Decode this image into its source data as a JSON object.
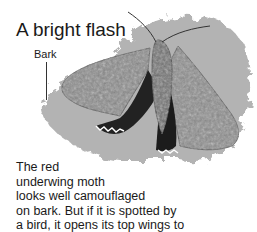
{
  "title": "A bright flash",
  "labels": {
    "bark": "Bark"
  },
  "illustration": {
    "subject": "red underwing moth on bark",
    "icon": "moth-illustration"
  },
  "caption": {
    "lines": [
      "The red",
      "underwing moth",
      "looks well camouflaged",
      "on bark. But if it is spotted by",
      "a bird, it opens its top wings to",
      "show the bright red underneath."
    ]
  }
}
